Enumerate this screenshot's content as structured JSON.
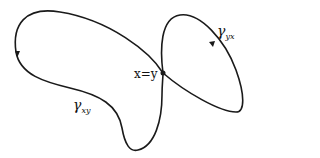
{
  "diagram": {
    "point_label": "x=y",
    "curves": [
      {
        "name": "gamma-xy",
        "symbol": "γ",
        "subscript": "xy"
      },
      {
        "name": "gamma-yx",
        "symbol": "γ",
        "subscript": "yx"
      }
    ],
    "colors": {
      "stroke": "#1a1a1a",
      "background": "#ffffff"
    }
  }
}
